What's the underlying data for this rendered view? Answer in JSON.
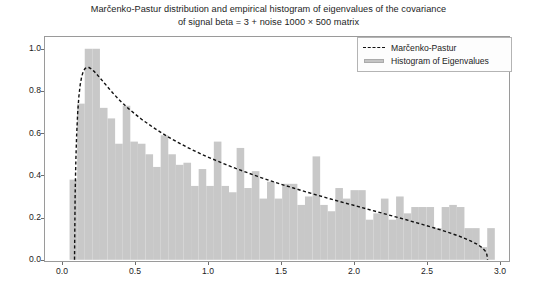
{
  "chart_data": {
    "type": "bar",
    "title": "Marčenko-Pastur distribution and empirical histogram of eigenvalues of the covariance of signal beta = 3 + noise 1000 × 500 matrix",
    "title_line1": "Marčenko-Pastur distribution and empirical histogram of eigenvalues of the covariance",
    "title_line2": "of signal beta = 3 + noise 1000 × 500 matrix",
    "xlabel": "",
    "ylabel": "",
    "xlim": [
      -0.123,
      3.068
    ],
    "ylim": [
      -0.0105,
      1.0605
    ],
    "xticks": [
      0.0,
      0.5,
      1.0,
      1.5,
      2.0,
      2.5,
      3.0
    ],
    "xtick_labels": [
      "0.0",
      "0.5",
      "1.0",
      "1.5",
      "2.0",
      "2.5",
      "3.0"
    ],
    "yticks": [
      0.0,
      0.2,
      0.4,
      0.6,
      0.8,
      1.0
    ],
    "ytick_labels": [
      "0.0",
      "0.2",
      "0.4",
      "0.6",
      "0.8",
      "1.0"
    ],
    "grid": false,
    "legend_position": "upper right",
    "legend": [
      {
        "label": "Marčenko-Pastur",
        "style": "dashed-line",
        "color": "#111111"
      },
      {
        "label": "Histogram of Eigenvalues",
        "style": "bar",
        "color": "#c4c4c4"
      }
    ],
    "series": [
      {
        "name": "Histogram of Eigenvalues",
        "type": "bar",
        "color": "#c8c8c8",
        "edgecolor": "#c8c8c8",
        "bin_width": 0.052,
        "bin_left_edges": [
          0.052,
          0.104,
          0.156,
          0.208,
          0.26,
          0.312,
          0.364,
          0.416,
          0.468,
          0.52,
          0.572,
          0.624,
          0.676,
          0.728,
          0.78,
          0.832,
          0.884,
          0.936,
          0.988,
          1.04,
          1.092,
          1.144,
          1.196,
          1.248,
          1.3,
          1.352,
          1.404,
          1.456,
          1.508,
          1.56,
          1.612,
          1.664,
          1.716,
          1.768,
          1.82,
          1.872,
          1.924,
          1.976,
          2.028,
          2.08,
          2.132,
          2.184,
          2.236,
          2.288,
          2.34,
          2.392,
          2.444,
          2.496,
          2.548,
          2.6,
          2.652,
          2.704,
          2.756,
          2.808,
          2.86,
          2.912,
          2.964
        ],
        "values": [
          0.38,
          0.74,
          1.0,
          1.0,
          0.72,
          0.67,
          0.55,
          0.73,
          0.56,
          0.55,
          0.5,
          0.44,
          0.59,
          0.5,
          0.45,
          0.46,
          0.35,
          0.43,
          0.35,
          0.56,
          0.35,
          0.32,
          0.53,
          0.34,
          0.42,
          0.29,
          0.37,
          0.29,
          0.36,
          0.36,
          0.26,
          0.3,
          0.49,
          0.26,
          0.23,
          0.34,
          0.29,
          0.33,
          0.33,
          0.19,
          0.22,
          0.29,
          0.19,
          0.3,
          0.22,
          0.25,
          0.25,
          0.25,
          0.15,
          0.25,
          0.26,
          0.25,
          0.15,
          0.15,
          0.06,
          0.15,
          0.0
        ]
      },
      {
        "name": "Marčenko-Pastur",
        "type": "line",
        "linestyle": "dashed",
        "color": "#111111",
        "linewidth": 1.4,
        "support": [
          0.086,
          2.914
        ],
        "peak": {
          "x": 0.17,
          "y": 0.912
        },
        "x": [
          0.086,
          0.09,
          0.095,
          0.101,
          0.108,
          0.116,
          0.125,
          0.135,
          0.146,
          0.158,
          0.17,
          0.185,
          0.2,
          0.22,
          0.24,
          0.265,
          0.29,
          0.32,
          0.35,
          0.385,
          0.42,
          0.46,
          0.5,
          0.545,
          0.59,
          0.64,
          0.69,
          0.745,
          0.8,
          0.86,
          0.92,
          0.985,
          1.05,
          1.12,
          1.19,
          1.265,
          1.34,
          1.42,
          1.5,
          1.585,
          1.67,
          1.76,
          1.85,
          1.945,
          2.04,
          2.14,
          2.24,
          2.345,
          2.45,
          2.545,
          2.64,
          2.72,
          2.79,
          2.845,
          2.88,
          2.9,
          2.91,
          2.914
        ],
        "y": [
          0.0,
          0.3,
          0.47,
          0.6,
          0.7,
          0.775,
          0.83,
          0.868,
          0.893,
          0.906,
          0.912,
          0.911,
          0.905,
          0.893,
          0.878,
          0.858,
          0.838,
          0.813,
          0.789,
          0.763,
          0.739,
          0.714,
          0.691,
          0.666,
          0.644,
          0.62,
          0.598,
          0.575,
          0.554,
          0.532,
          0.512,
          0.491,
          0.472,
          0.452,
          0.433,
          0.414,
          0.395,
          0.376,
          0.358,
          0.34,
          0.322,
          0.304,
          0.286,
          0.268,
          0.25,
          0.231,
          0.212,
          0.192,
          0.171,
          0.152,
          0.131,
          0.112,
          0.092,
          0.073,
          0.056,
          0.04,
          0.024,
          0.0
        ]
      }
    ]
  }
}
